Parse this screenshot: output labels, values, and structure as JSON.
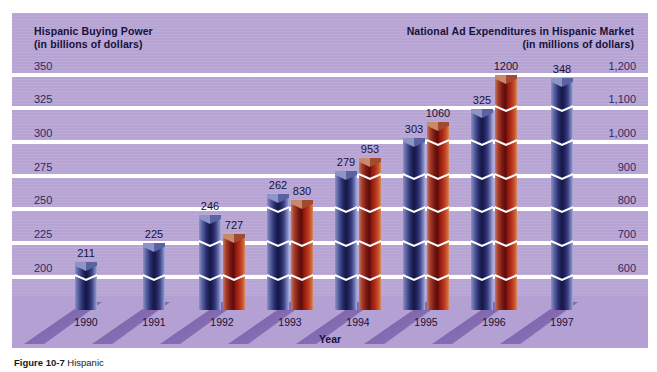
{
  "caption": {
    "figure_number": "Figure 10-7",
    "text": "Hispanic"
  },
  "left_axis": {
    "title_line1": "Hispanic Buying Power",
    "title_line2": "(in billions of dollars)",
    "ticks": [
      "350",
      "325",
      "300",
      "275",
      "250",
      "225",
      "200"
    ]
  },
  "right_axis": {
    "title_line1": "National Ad Expenditures in Hispanic Market",
    "title_line2": "(in millions of dollars)",
    "ticks": [
      "1,200",
      "1,100",
      "1,000",
      "900",
      "800",
      "700",
      "600"
    ]
  },
  "x_axis": {
    "title": "Year",
    "ticks": [
      "1990",
      "1991",
      "1992",
      "1993",
      "1994",
      "1995",
      "1996",
      "1997"
    ]
  },
  "value_labels": {
    "buying_power": [
      "211",
      "225",
      "246",
      "262",
      "279",
      "303",
      "325",
      "348"
    ],
    "ad_spend": [
      "",
      "",
      "727",
      "830",
      "953",
      "1060",
      "1200",
      ""
    ]
  },
  "colors": {
    "panel_background": "#b9a6d6",
    "gridline": "#ffffff",
    "buying_power_bar": "#2a2d6e",
    "ad_spend_bar": "#8e1b12",
    "text": "#15123a",
    "tick_text": "#2e2a63",
    "shadow": "#6b4f9e"
  },
  "chart_data": {
    "type": "bar",
    "title": "",
    "categories": [
      "1990",
      "1991",
      "1992",
      "1993",
      "1994",
      "1995",
      "1996",
      "1997"
    ],
    "xlabel": "Year",
    "grid": true,
    "legend": "none",
    "series": [
      {
        "name": "Hispanic Buying Power",
        "unit": "billions of dollars",
        "axis": "left",
        "color": "#2a2d6e",
        "values": [
          211,
          225,
          246,
          262,
          279,
          303,
          325,
          348
        ],
        "ylabel": "Hispanic Buying Power (in billions of dollars)",
        "yticks": [
          200,
          225,
          250,
          275,
          300,
          325,
          350
        ],
        "ylim": [
          187.5,
          362.5
        ]
      },
      {
        "name": "National Ad Expenditures in Hispanic Market",
        "unit": "millions of dollars",
        "axis": "right",
        "color": "#8e1b12",
        "values": [
          null,
          null,
          727,
          830,
          953,
          1060,
          1200,
          null
        ],
        "ylabel": "National Ad Expenditures in Hispanic Market (in millions of dollars)",
        "yticks": [
          600,
          700,
          800,
          900,
          1000,
          1100,
          1200
        ],
        "ylim": [
          550,
          1250
        ]
      }
    ]
  }
}
